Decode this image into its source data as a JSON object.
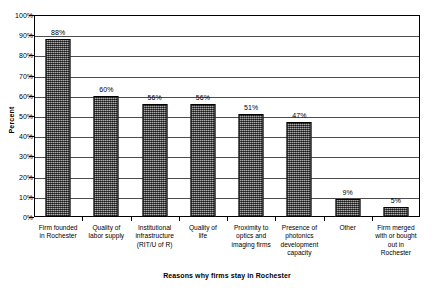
{
  "chart_data": {
    "type": "bar",
    "title": "",
    "xlabel": "Reasons why firms stay in Rochester",
    "ylabel": "Percent",
    "ylim": [
      0,
      100
    ],
    "grid": true,
    "legend": false,
    "categories": [
      "Firm founded in Rochester",
      "Quality of labor supply",
      "Institutional infrastructure (RIT/U of R)",
      "Quality of life",
      "Proximity to optics and imaging firms",
      "Presence of photonics development capacity",
      "Other",
      "Firm merged with or bought out in Rochester"
    ],
    "category_lines": [
      [
        "Firm founded",
        "in Rochester"
      ],
      [
        "Quality of",
        "labor supply"
      ],
      [
        "Institutional",
        "infrastructure",
        "(RIT/U of R)"
      ],
      [
        "Quality of",
        "life"
      ],
      [
        "Proximity to",
        "optics and",
        "imaging firms"
      ],
      [
        "Presence of",
        "photonics",
        "development",
        "capacity"
      ],
      [
        "Other"
      ],
      [
        "Firm merged",
        "with or bought",
        "out in",
        "Rochester"
      ]
    ],
    "values": [
      88,
      60,
      56,
      56,
      51,
      47,
      9,
      5
    ],
    "value_labels": [
      "88%",
      "60%",
      "56%",
      "56%",
      "51%",
      "47%",
      "9%",
      "5%"
    ],
    "y_ticks": [
      0,
      10,
      20,
      30,
      40,
      50,
      60,
      70,
      80,
      90,
      100
    ],
    "y_tick_labels": [
      "0%",
      "10%",
      "20%",
      "30%",
      "40%",
      "50%",
      "60%",
      "70%",
      "80%",
      "90%",
      "100%"
    ],
    "colors": {
      "bar_fill": "#6e6e6e",
      "bar_border": "#000000",
      "gridline": "#4d4d4d",
      "axis": "#000000",
      "background": "#ffffff",
      "text": "#000000"
    }
  }
}
